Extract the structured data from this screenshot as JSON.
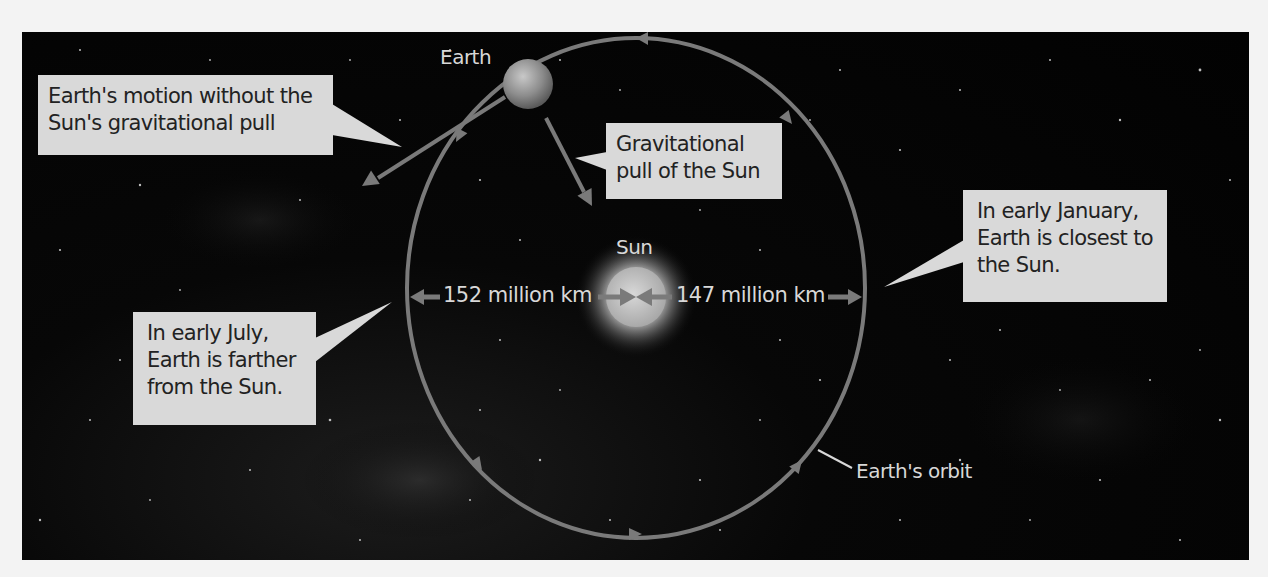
{
  "figure": {
    "colors": {
      "background": "#030303",
      "page": "#f3f3f3",
      "callout_fill": "#d9d9d9",
      "callout_text": "#222222",
      "orbit_line": "#7a7a7a",
      "label_text": "#d8d8d8"
    }
  },
  "labels": {
    "earth": "Earth",
    "sun": "Sun",
    "orbit": "Earth's orbit",
    "distance_far": "152 million km",
    "distance_near": "147 million km"
  },
  "callouts": {
    "inertia": {
      "line1": "Earth's motion without the",
      "line2": "Sun's gravitational pull"
    },
    "gravity": {
      "line1": "Gravitational",
      "line2": "pull of the Sun"
    },
    "january": {
      "line1": "In early January,",
      "line2": "Earth is closest to",
      "line3": "the Sun."
    },
    "july": {
      "line1": "In early July,",
      "line2": "Earth is farther",
      "line3": "from the Sun."
    }
  },
  "icons": {
    "earth": "earth-icon",
    "sun": "sun-icon",
    "orbit": "orbit-ellipse",
    "direction_arrows": "arrow-icon"
  }
}
